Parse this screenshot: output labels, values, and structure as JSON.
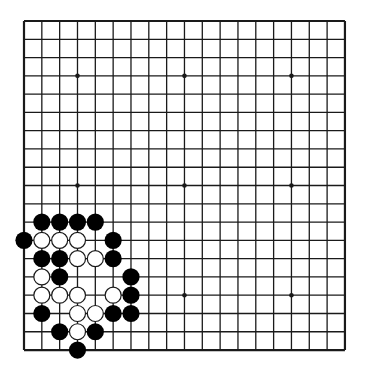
{
  "board": {
    "size": 19,
    "origin_x": 24,
    "origin_y": 21,
    "spacing_x": 17.83,
    "spacing_y": 18.28,
    "stone_radius": 8.6,
    "line_color": "#1a1a1a",
    "black_color": "#000000",
    "white_fill": "#ffffff",
    "white_stroke": "#1a1a1a",
    "star_points": [
      [
        3,
        3
      ],
      [
        9,
        3
      ],
      [
        15,
        3
      ],
      [
        3,
        9
      ],
      [
        9,
        9
      ],
      [
        15,
        9
      ],
      [
        3,
        15
      ],
      [
        9,
        15
      ],
      [
        15,
        15
      ]
    ]
  },
  "stones": [
    {
      "color": "black",
      "col": 1,
      "row": 11
    },
    {
      "color": "black",
      "col": 2,
      "row": 11
    },
    {
      "color": "black",
      "col": 3,
      "row": 11
    },
    {
      "color": "black",
      "col": 4,
      "row": 11
    },
    {
      "color": "black",
      "col": 0,
      "row": 12
    },
    {
      "color": "white",
      "col": 1,
      "row": 12
    },
    {
      "color": "white",
      "col": 2,
      "row": 12
    },
    {
      "color": "white",
      "col": 3,
      "row": 12
    },
    {
      "color": "black",
      "col": 5,
      "row": 12
    },
    {
      "color": "black",
      "col": 1,
      "row": 13
    },
    {
      "color": "black",
      "col": 2,
      "row": 13
    },
    {
      "color": "white",
      "col": 3,
      "row": 13
    },
    {
      "color": "white",
      "col": 4,
      "row": 13
    },
    {
      "color": "black",
      "col": 5,
      "row": 13
    },
    {
      "color": "white",
      "col": 1,
      "row": 14
    },
    {
      "color": "black",
      "col": 2,
      "row": 14
    },
    {
      "color": "black",
      "col": 6,
      "row": 14
    },
    {
      "color": "white",
      "col": 1,
      "row": 15
    },
    {
      "color": "white",
      "col": 2,
      "row": 15
    },
    {
      "color": "white",
      "col": 3,
      "row": 15
    },
    {
      "color": "white",
      "col": 5,
      "row": 15
    },
    {
      "color": "black",
      "col": 6,
      "row": 15
    },
    {
      "color": "black",
      "col": 1,
      "row": 16
    },
    {
      "color": "white",
      "col": 3,
      "row": 16
    },
    {
      "color": "white",
      "col": 4,
      "row": 16
    },
    {
      "color": "black",
      "col": 5,
      "row": 16
    },
    {
      "color": "black",
      "col": 6,
      "row": 16
    },
    {
      "color": "black",
      "col": 2,
      "row": 17
    },
    {
      "color": "white",
      "col": 3,
      "row": 17
    },
    {
      "color": "black",
      "col": 4,
      "row": 17
    },
    {
      "color": "black",
      "col": 3,
      "row": 18
    }
  ]
}
